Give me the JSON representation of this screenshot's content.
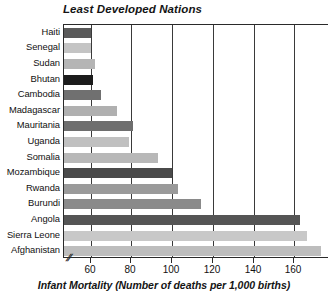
{
  "chart_data": {
    "type": "bar",
    "orientation": "horizontal",
    "title": "Least Developed Nations",
    "xlabel": "Infant Mortality (Number of deaths per 1,000 births)",
    "ylabel": "",
    "grid": true,
    "legend": "none",
    "axis_break": true,
    "axis_break_symbol": "//",
    "xlim": [
      47,
      177
    ],
    "xticks": [
      60,
      80,
      100,
      120,
      140,
      160
    ],
    "xticklabels": [
      "60",
      "80",
      "100",
      "120",
      "140",
      "160"
    ],
    "categories": [
      "Haiti",
      "Senegal",
      "Sudan",
      "Bhutan",
      "Cambodia",
      "Madagascar",
      "Mauritania",
      "Uganda",
      "Somalia",
      "Mozambique",
      "Rwanda",
      "Burundi",
      "Angola",
      "Sierra Leone",
      "Afghanistan"
    ],
    "values": [
      60,
      60,
      62,
      61,
      65,
      73,
      81,
      79,
      93,
      100,
      103,
      114,
      163,
      166,
      173
    ],
    "bar_colors": [
      "#5a5a5a",
      "#c4c4c4",
      "#b5b5b5",
      "#1c1c1c",
      "#707070",
      "#b0b0b0",
      "#6e6e6e",
      "#c0c0c0",
      "#b8b8b8",
      "#4a4a4a",
      "#9a9a9a",
      "#8a8a8a",
      "#555555",
      "#c8c8c8",
      "#bdbdbd"
    ],
    "colors": {
      "axis": "#2a2a2a",
      "grid": "#3a3a3a",
      "text": "#111111",
      "background": "#ffffff"
    }
  }
}
